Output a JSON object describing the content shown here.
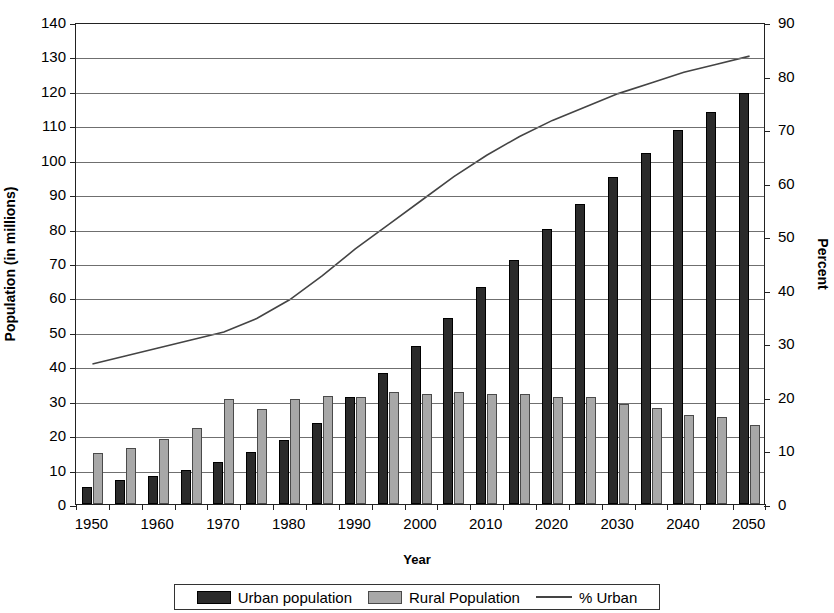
{
  "chart_data": {
    "type": "bar",
    "title": "",
    "xlabel": "Year",
    "ylabel": "Population (in millions)",
    "ylabel_secondary": "Percent",
    "grid": true,
    "legend_position": "bottom",
    "ylim": [
      0,
      140
    ],
    "ylim_secondary": [
      0,
      90
    ],
    "ytick_step": 10,
    "ytick_step_secondary": 10,
    "yticks": [
      "0",
      "10",
      "20",
      "30",
      "40",
      "50",
      "60",
      "70",
      "80",
      "90",
      "100",
      "110",
      "120",
      "130",
      "140"
    ],
    "yticks_secondary": [
      "0",
      "10",
      "20",
      "30",
      "40",
      "50",
      "60",
      "70",
      "80",
      "90"
    ],
    "xticks": [
      "1950",
      "1960",
      "1970",
      "1980",
      "1990",
      "2000",
      "2010",
      "2020",
      "2030",
      "2040",
      "2050"
    ],
    "categories": [
      1950,
      1955,
      1960,
      1965,
      1970,
      1975,
      1980,
      1985,
      1990,
      1995,
      2000,
      2005,
      2010,
      2015,
      2020,
      2025,
      2030,
      2035,
      2040,
      2045,
      2050
    ],
    "series": [
      {
        "name": "Urban population",
        "type": "bar",
        "axis": "left",
        "color": "#2b2b2b",
        "values": [
          5.0,
          7.0,
          8.0,
          10.0,
          12.2,
          15.2,
          18.5,
          23.5,
          31.0,
          38.0,
          46.0,
          54.0,
          63.0,
          71.0,
          80.0,
          87.0,
          95.0,
          102.0,
          108.5,
          114.0,
          119.5
        ]
      },
      {
        "name": "Rural Population",
        "type": "bar",
        "axis": "left",
        "color": "#a8a8a8",
        "values": [
          14.8,
          16.2,
          19.0,
          22.0,
          30.5,
          27.5,
          30.5,
          31.5,
          31.0,
          32.5,
          32.0,
          32.5,
          32.0,
          32.0,
          31.0,
          31.0,
          29.0,
          28.0,
          26.0,
          25.2,
          23.0
        ]
      },
      {
        "name": "% Urban",
        "type": "line",
        "axis": "right",
        "color": "#444444",
        "values": [
          26.5,
          28.0,
          29.5,
          31.0,
          32.5,
          35.0,
          38.5,
          43.0,
          48.0,
          52.5,
          57.0,
          61.5,
          65.5,
          69.0,
          72.0,
          74.5,
          77.0,
          79.0,
          81.0,
          82.5,
          84.0
        ]
      }
    ],
    "legend": [
      "Urban population",
      "Rural Population",
      "% Urban"
    ]
  }
}
